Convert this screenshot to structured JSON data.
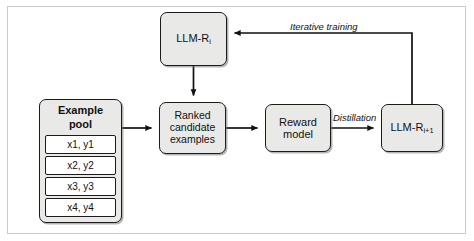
{
  "figure": {
    "type": "flow-diagram"
  },
  "nodes": {
    "llm_ri": {
      "label_main": "LLM-R",
      "label_sub": "i",
      "name": "llm-ri"
    },
    "ranked": {
      "label": "Ranked\ncandidate\nexamples",
      "name": "ranked-candidate-examples"
    },
    "reward": {
      "label": "Reward\nmodel",
      "name": "reward-model"
    },
    "llm_ri1": {
      "label_main": "LLM-R",
      "label_sub": "i+1",
      "name": "llm-ri-plus-1"
    },
    "pool": {
      "title": "Example pool",
      "rows": [
        "x1, y1",
        "x2, y2",
        "x3, y3",
        "x4, y4"
      ]
    }
  },
  "edges": {
    "pool_to_ranked": {
      "label": ""
    },
    "llm_ri_to_ranked": {
      "label": ""
    },
    "ranked_to_reward": {
      "label": ""
    },
    "reward_to_llm_ri1": {
      "label": "Distillation"
    },
    "llm_ri1_to_llm_ri": {
      "label": "Iterative training"
    }
  },
  "colors": {
    "node_fill": "#e9e9e7",
    "node_stroke": "#1b1b1b",
    "row_fill": "#ffffff",
    "frame_stroke": "#c9c9c9",
    "text": "#111111",
    "background": "#ffffff"
  }
}
